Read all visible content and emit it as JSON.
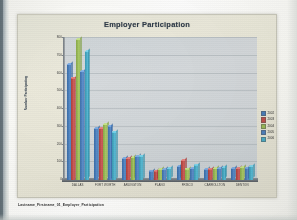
{
  "document": {
    "caption": "Lastname_Firstname_01_Employer_Participation",
    "page_background": "#ffffff"
  },
  "chart": {
    "title": "Employer Participation",
    "plot_background": "#d2d7da",
    "chart_background": "#e9e7d8"
  },
  "legend": {
    "position": "right",
    "entries": [
      {
        "label": "2002",
        "color": "#4a7ebb"
      },
      {
        "label": "2003",
        "color": "#c0504d"
      },
      {
        "label": "2004",
        "color": "#9bbb59"
      },
      {
        "label": "2005",
        "color": "#4f81bd"
      },
      {
        "label": "2006",
        "color": "#4bacc6"
      }
    ]
  },
  "chart_data": {
    "type": "bar",
    "title": "Employer Participation",
    "xlabel": "",
    "ylabel": "Number Participating",
    "ylim": [
      0,
      800
    ],
    "yticks": [
      0,
      100,
      200,
      300,
      400,
      500,
      600,
      700,
      800
    ],
    "ytick_labels": [
      "0",
      "100",
      "200",
      "300",
      "400",
      "500",
      "600",
      "700",
      "800"
    ],
    "grid": true,
    "legend_position": "right",
    "categories": [
      "DALLAS",
      "FORT WORTH",
      "ARLINGTON",
      "PLANO",
      "FRISCO",
      "CARROLLTON",
      "DENTON"
    ],
    "series": [
      {
        "name": "2002",
        "color": "#4a7ebb",
        "values": [
          648,
          288,
          120,
          48,
          76,
          58,
          62
        ]
      },
      {
        "name": "2003",
        "color": "#c0504d",
        "values": [
          572,
          290,
          118,
          50,
          108,
          60,
          64
        ]
      },
      {
        "name": "2004",
        "color": "#9bbb59",
        "values": [
          790,
          312,
          126,
          56,
          60,
          62,
          70
        ]
      },
      {
        "name": "2005",
        "color": "#4f81bd",
        "values": [
          608,
          302,
          132,
          58,
          64,
          64,
          66
        ]
      },
      {
        "name": "2006",
        "color": "#4bacc6",
        "values": [
          722,
          268,
          134,
          62,
          82,
          68,
          74
        ]
      }
    ]
  }
}
